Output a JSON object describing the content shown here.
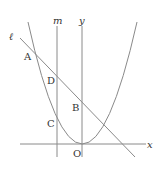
{
  "figure": {
    "labels": {
      "line_l": "ℓ",
      "line_m": "m",
      "y_axis": "y",
      "x_axis": "x",
      "origin": "O",
      "point_A": "A",
      "point_B": "B",
      "point_C": "C",
      "point_D": "D"
    },
    "colors": {
      "stroke": "#8a8a8a",
      "text": "#333333",
      "background": "#ffffff"
    }
  }
}
